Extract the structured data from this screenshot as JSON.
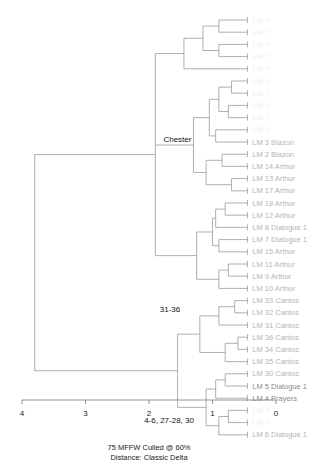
{
  "chart_data": {
    "type": "dendrogram",
    "title": "",
    "caption_lines": [
      "75 MFFW  Culled @ 60%",
      "Distance: Classic Delta"
    ],
    "xlabel": "",
    "xlim": [
      4,
      0
    ],
    "ticks": [
      "4",
      "3",
      "2",
      "1",
      "0"
    ],
    "leaves": [
      {
        "label": "LM ?",
        "style": "faint"
      },
      {
        "label": "LM ?",
        "style": "faint"
      },
      {
        "label": "LM ?",
        "style": "faint"
      },
      {
        "label": "LM ?",
        "style": "faint"
      },
      {
        "label": "LM ?",
        "style": "faint"
      },
      {
        "label": "LM ?",
        "style": "faint"
      },
      {
        "label": "LM ?",
        "style": "faint"
      },
      {
        "label": "LM ?",
        "style": "faint"
      },
      {
        "label": "LM ?",
        "style": "faint"
      },
      {
        "label": "LM ?",
        "style": "faint"
      },
      {
        "label": "LM 3 Blazon",
        "style": "normal"
      },
      {
        "label": "LM 2 Blazon",
        "style": "normal"
      },
      {
        "label": "LM 14 Arthur",
        "style": "normal"
      },
      {
        "label": "LM 13 Arthur",
        "style": "normal"
      },
      {
        "label": "LM 17 Arthur",
        "style": "normal"
      },
      {
        "label": "LM 18 Arthur",
        "style": "normal"
      },
      {
        "label": "LM 12 Arthur",
        "style": "normal"
      },
      {
        "label": "LM 8 Dialogue 1",
        "style": "normal"
      },
      {
        "label": "LM 7 Dialogue 1",
        "style": "normal"
      },
      {
        "label": "LM 15 Arthur",
        "style": "normal"
      },
      {
        "label": "LM 11 Arthur",
        "style": "normal"
      },
      {
        "label": "LM 9 Arthur",
        "style": "normal"
      },
      {
        "label": "LM 10 Arthur",
        "style": "normal"
      },
      {
        "label": "LM 33 Cantos",
        "style": "normal"
      },
      {
        "label": "LM 32 Cantos",
        "style": "normal"
      },
      {
        "label": "LM 31 Cantos",
        "style": "normal"
      },
      {
        "label": "LM 36 Cantos",
        "style": "normal"
      },
      {
        "label": "LM 34 Cantos",
        "style": "normal"
      },
      {
        "label": "LM 35 Cantos",
        "style": "normal"
      },
      {
        "label": "LM 30 Cantos",
        "style": "normal"
      },
      {
        "label": "LM 5 Dialogue 1",
        "style": "dark"
      },
      {
        "label": "LM 4 Prayers",
        "style": "dark"
      },
      {
        "label": "LM ?",
        "style": "faint"
      },
      {
        "label": "LM ?",
        "style": "faint"
      },
      {
        "label": "LM 6 Dialogue 1",
        "style": "normal"
      }
    ],
    "node_labels": [
      {
        "text": "Chester",
        "node": "chester"
      },
      {
        "text": "31-36",
        "node": "cantos"
      },
      {
        "text": "4-6, 27-28, 30",
        "node": "prayers"
      }
    ],
    "tree": {
      "id": "root",
      "h": 3.8,
      "children": [
        {
          "id": "top",
          "h": 1.9,
          "children": [
            {
              "id": "t1",
              "h": 1.45,
              "children": [
                {
                  "id": "t1a",
                  "h": 1.15,
                  "children": [
                    {
                      "id": "t1a1",
                      "h": 0.9,
                      "children": [
                        {
                          "leaf": 0,
                          "h": 0.6
                        },
                        {
                          "leaf": 1,
                          "h": 0.6
                        }
                      ]
                    },
                    {
                      "id": "t1a2",
                      "h": 0.9,
                      "children": [
                        {
                          "leaf": 2,
                          "h": 0.55
                        },
                        {
                          "leaf": 3,
                          "h": 0.55
                        }
                      ]
                    }
                  ]
                },
                {
                  "leaf": 4,
                  "h": 1.15
                }
              ]
            },
            {
              "id": "chester",
              "h": 1.3,
              "children": [
                {
                  "id": "c1",
                  "h": 1.05,
                  "children": [
                    {
                      "id": "c1a",
                      "h": 0.9,
                      "children": [
                        {
                          "id": "c1a1",
                          "h": 0.7,
                          "children": [
                            {
                              "leaf": 5,
                              "h": 0.65
                            },
                            {
                              "leaf": 6,
                              "h": 0.65
                            }
                          ]
                        },
                        {
                          "id": "c1a2",
                          "h": 0.75,
                          "children": [
                            {
                              "leaf": 7,
                              "h": 0.55
                            },
                            {
                              "leaf": 8,
                              "h": 0.55
                            }
                          ]
                        }
                      ]
                    },
                    {
                      "id": "c1b",
                      "h": 0.95,
                      "children": [
                        {
                          "leaf": 9,
                          "h": 0.8
                        },
                        {
                          "leaf": 10,
                          "h": 0.8
                        }
                      ]
                    }
                  ]
                },
                {
                  "id": "c2",
                  "h": 1.1,
                  "children": [
                    {
                      "id": "c2a",
                      "h": 0.85,
                      "children": [
                        {
                          "leaf": 11,
                          "h": 0.8
                        },
                        {
                          "leaf": 12,
                          "h": 0.8
                        }
                      ]
                    },
                    {
                      "id": "c2b",
                      "h": 0.7,
                      "children": [
                        {
                          "leaf": 13,
                          "h": 0.75
                        },
                        {
                          "leaf": 14,
                          "h": 0.75
                        }
                      ]
                    }
                  ]
                }
              ]
            },
            {
              "id": "arthur",
              "h": 1.25,
              "children": [
                {
                  "id": "a1",
                  "h": 1.0,
                  "children": [
                    {
                      "id": "a1a",
                      "h": 0.95,
                      "children": [
                        {
                          "id": "a1a1",
                          "h": 0.8,
                          "children": [
                            {
                              "leaf": 15,
                              "h": 0.65
                            },
                            {
                              "leaf": 16,
                              "h": 0.65
                            }
                          ]
                        },
                        {
                          "leaf": 17,
                          "h": 0.8
                        }
                      ]
                    },
                    {
                      "id": "a1b",
                      "h": 0.9,
                      "children": [
                        {
                          "leaf": 18,
                          "h": 0.65
                        },
                        {
                          "leaf": 19,
                          "h": 0.65
                        }
                      ]
                    }
                  ]
                },
                {
                  "id": "a2",
                  "h": 0.9,
                  "children": [
                    {
                      "id": "a2a",
                      "h": 0.75,
                      "children": [
                        {
                          "leaf": 20,
                          "h": 0.65
                        },
                        {
                          "leaf": 21,
                          "h": 0.65
                        }
                      ]
                    },
                    {
                      "leaf": 22,
                      "h": 0.75
                    }
                  ]
                }
              ]
            }
          ]
        },
        {
          "id": "bottom",
          "h": 1.55,
          "children": [
            {
              "id": "cantos",
              "h": 1.2,
              "children": [
                {
                  "id": "cn1",
                  "h": 0.9,
                  "children": [
                    {
                      "id": "cn1a",
                      "h": 0.65,
                      "children": [
                        {
                          "leaf": 23,
                          "h": 0.6
                        },
                        {
                          "leaf": 24,
                          "h": 0.6
                        }
                      ]
                    },
                    {
                      "leaf": 25,
                      "h": 0.65
                    }
                  ]
                },
                {
                  "id": "cn2",
                  "h": 0.8,
                  "children": [
                    {
                      "id": "cn2a",
                      "h": 0.6,
                      "children": [
                        {
                          "leaf": 26,
                          "h": 0.55
                        },
                        {
                          "leaf": 27,
                          "h": 0.55
                        }
                      ]
                    },
                    {
                      "leaf": 28,
                      "h": 0.6
                    }
                  ]
                }
              ]
            },
            {
              "id": "prayers",
              "h": 1.1,
              "children": [
                {
                  "id": "p1",
                  "h": 0.95,
                  "children": [
                    {
                      "id": "p1a",
                      "h": 0.8,
                      "children": [
                        {
                          "leaf": 29,
                          "h": 0.6
                        },
                        {
                          "leaf": 30,
                          "h": 0.6
                        }
                      ]
                    },
                    {
                      "leaf": 31,
                      "h": 0.8
                    }
                  ]
                },
                {
                  "id": "p2",
                  "h": 0.9,
                  "children": [
                    {
                      "id": "p2a",
                      "h": 0.75,
                      "children": [
                        {
                          "leaf": 32,
                          "h": 0.6
                        },
                        {
                          "leaf": 33,
                          "h": 0.6
                        }
                      ]
                    },
                    {
                      "leaf": 34,
                      "h": 0.75
                    }
                  ]
                }
              ]
            }
          ]
        }
      ]
    }
  },
  "colors": {
    "branch": "#9a9a9a",
    "axis": "#777777",
    "leaf_text": "#b5b5b5",
    "node_text": "#111111"
  }
}
